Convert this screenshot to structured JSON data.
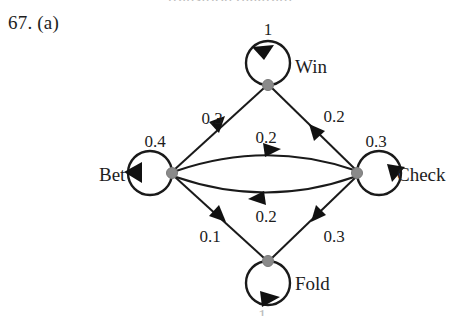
{
  "page": {
    "problem_number": "67. (a)",
    "top_cutoff_text": "transition diagram",
    "bottom_cutoff_text": "1",
    "background_color": "#ffffff",
    "ink_color": "#1a1a1a",
    "node_dot_color": "#8a8a8a"
  },
  "diagram": {
    "type": "state-transition-diagram",
    "nodes": [
      {
        "id": "win",
        "label": "Win",
        "x": 268,
        "y": 85,
        "label_x": 295,
        "label_y": 73
      },
      {
        "id": "bet",
        "label": "Bet",
        "x": 172,
        "y": 173,
        "label_x": 99,
        "label_y": 181
      },
      {
        "id": "check",
        "label": "Check",
        "x": 357,
        "y": 173,
        "label_x": 397,
        "label_y": 181
      },
      {
        "id": "fold",
        "label": "Fold",
        "x": 268,
        "y": 261,
        "label_x": 295,
        "label_y": 290
      }
    ],
    "self_loops": [
      {
        "id": "win-loop",
        "from": "win",
        "to": "win",
        "weight": "1",
        "label_x": 268,
        "label_y": 35,
        "arrow": "top-left"
      },
      {
        "id": "bet-loop",
        "from": "bet",
        "to": "bet",
        "weight": "0.4",
        "label_x": 155,
        "label_y": 147,
        "arrow": "left"
      },
      {
        "id": "check-loop",
        "from": "check",
        "to": "check",
        "weight": "0.3",
        "label_x": 376,
        "label_y": 147,
        "arrow": "right"
      },
      {
        "id": "fold-loop",
        "from": "fold",
        "to": "fold",
        "weight": "1",
        "label_x": 268,
        "label_y": 318,
        "arrow": "bottom"
      }
    ],
    "edges": [
      {
        "id": "bet-win",
        "from": "bet",
        "to": "win",
        "weight": "0.3",
        "label_x": 212,
        "label_y": 124,
        "curve": "straight"
      },
      {
        "id": "win-check",
        "from": "win",
        "to": "check",
        "weight": "0.2",
        "label_x": 334,
        "label_y": 122,
        "curve": "straight"
      },
      {
        "id": "bet-check",
        "from": "bet",
        "to": "check",
        "weight": "0.2",
        "label_x": 266,
        "label_y": 143,
        "curve": "arc-up"
      },
      {
        "id": "check-bet",
        "from": "check",
        "to": "bet",
        "weight": "0.2",
        "label_x": 266,
        "label_y": 222,
        "curve": "arc-down"
      },
      {
        "id": "bet-fold",
        "from": "bet",
        "to": "fold",
        "weight": "0.1",
        "label_x": 210,
        "label_y": 242,
        "curve": "straight"
      },
      {
        "id": "fold-check",
        "from": "fold",
        "to": "check",
        "weight": "0.3",
        "label_x": 334,
        "label_y": 242,
        "curve": "straight"
      }
    ]
  }
}
